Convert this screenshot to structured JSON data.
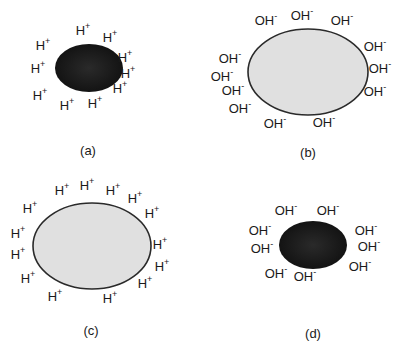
{
  "colors": {
    "dark_particle_center": "#1a1a1a",
    "dark_particle_edge": "#333333",
    "light_particle_fill": "#e0e0e0",
    "light_particle_stroke": "#2a2a2a",
    "text": "#1a1a1a"
  },
  "panels": [
    {
      "label": "(a)",
      "particle": "dark-small",
      "ion": "H",
      "charge": "+",
      "ion_count": 10
    },
    {
      "label": "(b)",
      "particle": "light-large",
      "ion": "OH",
      "charge": "-",
      "ion_count": 12
    },
    {
      "label": "(c)",
      "particle": "light-large",
      "ion": "H",
      "charge": "+",
      "ion_count": 14
    },
    {
      "label": "(d)",
      "particle": "dark-small",
      "ion": "OH",
      "charge": "-",
      "ion_count": 9
    }
  ]
}
